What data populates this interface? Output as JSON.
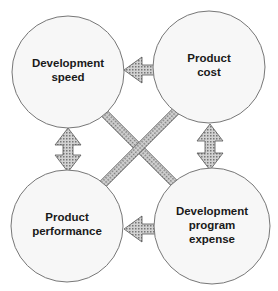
{
  "diagram": {
    "nodes": [
      {
        "id": "dev_speed",
        "lines": [
          "Development",
          "speed"
        ]
      },
      {
        "id": "product_cost",
        "lines": [
          "Product",
          "cost"
        ]
      },
      {
        "id": "product_performance",
        "lines": [
          "Product",
          "performance"
        ]
      },
      {
        "id": "dev_program_expense",
        "lines": [
          "Development",
          "program",
          "expense"
        ]
      }
    ],
    "edges": [
      {
        "from": "dev_speed",
        "to": "product_cost",
        "type": "bidirectional"
      },
      {
        "from": "dev_speed",
        "to": "product_performance",
        "type": "bidirectional"
      },
      {
        "from": "product_cost",
        "to": "dev_program_expense",
        "type": "bidirectional"
      },
      {
        "from": "product_performance",
        "to": "dev_program_expense",
        "type": "bidirectional"
      },
      {
        "from": "dev_speed",
        "to": "dev_program_expense",
        "type": "bidirectional"
      },
      {
        "from": "product_cost",
        "to": "product_performance",
        "type": "bidirectional"
      }
    ],
    "colors": {
      "circle_fill": "#f7f7f7",
      "circle_stroke": "#777777",
      "arrow_fill": "#b8b8b8",
      "arrow_stroke": "#555555"
    }
  }
}
